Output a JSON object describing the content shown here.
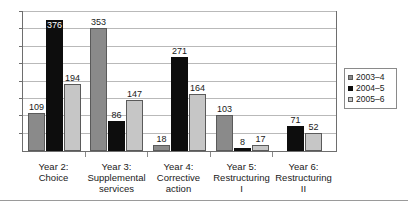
{
  "chart_data": {
    "type": "bar",
    "title": "",
    "subtitle": "",
    "xlabel": "",
    "ylabel": "",
    "ylim": [
      0,
      400
    ],
    "grid": true,
    "gridline_values": [
      50,
      100,
      150,
      200,
      250,
      300,
      350,
      400
    ],
    "legend_position": "right",
    "axis_tick_labels": [],
    "categories": [
      "Year 2:\nChoice",
      "Year 3:\nSupplemental\nservices",
      "Year 4:\nCorrective\naction",
      "Year 5:\nRestructuring\nI",
      "Year 6:\nRestructuring\nII"
    ],
    "category_lines": [
      [
        "Year 2:",
        "Choice"
      ],
      [
        "Year 3:",
        "Supplemental",
        "services"
      ],
      [
        "Year 4:",
        "Corrective",
        "action"
      ],
      [
        "Year 5:",
        "Restructuring",
        "I"
      ],
      [
        "Year 6:",
        "Restructuring",
        "II"
      ]
    ],
    "series": [
      {
        "name": "2003–4",
        "color": "#8a8a8a",
        "values": [
          109,
          353,
          18,
          103,
          null
        ]
      },
      {
        "name": "2004–5",
        "color": "#0d0d0d",
        "values": [
          376,
          86,
          271,
          8,
          71
        ]
      },
      {
        "name": "2005–6",
        "color": "#c6c6c6",
        "values": [
          194,
          147,
          164,
          17,
          52
        ]
      }
    ]
  },
  "legend": {
    "items": [
      {
        "label": "2003–4",
        "swatch_class": "s0"
      },
      {
        "label": "2004–5",
        "swatch_class": "s1"
      },
      {
        "label": "2005–6",
        "swatch_class": "s2"
      }
    ]
  }
}
